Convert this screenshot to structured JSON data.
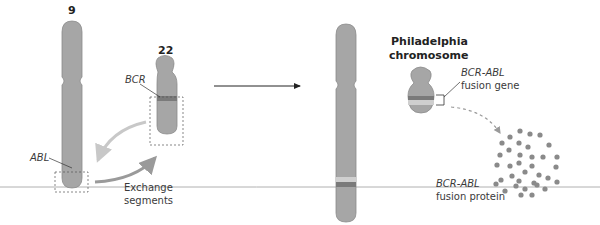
{
  "diagram": {
    "chromosome_9": {
      "label": "9",
      "gene": "ABL"
    },
    "chromosome_22": {
      "label": "22",
      "gene": "BCR"
    },
    "exchange_label_line1": "Exchange",
    "exchange_label_line2": "segments",
    "philadelphia_line1": "Philadelphia",
    "philadelphia_line2": "chromosome",
    "fusion_gene_name": "BCR-ABL",
    "fusion_gene_label": "fusion gene",
    "fusion_protein_name": "BCR-ABL",
    "fusion_protein_label": "fusion protein",
    "colors": {
      "chromosome": "#a6a6a6",
      "chromosome_outline": "#8c8c8c",
      "bcr_band": "#7a7a7a",
      "abl_band": "#cfcfcf",
      "arrow_light": "#c8c8c8",
      "arrow_dark": "#9a9a9a",
      "protein_dot": "#8a8a8a",
      "baseline": "#b0b0b0"
    }
  }
}
